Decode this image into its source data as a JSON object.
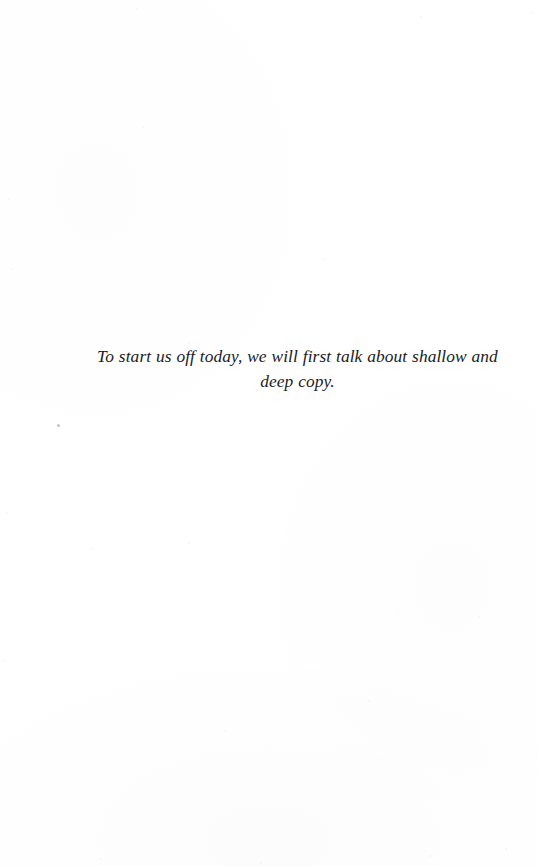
{
  "page": {
    "background_color": "#ffffff",
    "text_color": "#1b1b1f",
    "width": 537,
    "height": 866
  },
  "epigraph": {
    "line_1": "To start us off today, we will first talk about shallow and",
    "line_2": "deep copy.",
    "full_text": "To start us off today, we will first talk about shallow and deep copy.",
    "style": "italic",
    "alignment": "center"
  },
  "artifacts": {
    "speck_label": "scan-speck",
    "noise": [
      {
        "x": 136,
        "y": 8
      },
      {
        "x": 420,
        "y": 16
      },
      {
        "x": 530,
        "y": 12
      },
      {
        "x": 142,
        "y": 126
      },
      {
        "x": 8,
        "y": 198
      },
      {
        "x": 12,
        "y": 268
      },
      {
        "x": 188,
        "y": 342
      },
      {
        "x": 322,
        "y": 258
      },
      {
        "x": 6,
        "y": 512
      },
      {
        "x": 92,
        "y": 548
      },
      {
        "x": 188,
        "y": 542
      },
      {
        "x": 478,
        "y": 616
      },
      {
        "x": 3,
        "y": 660
      },
      {
        "x": 224,
        "y": 730
      },
      {
        "x": 368,
        "y": 700
      },
      {
        "x": 100,
        "y": 858
      },
      {
        "x": 260,
        "y": 862
      },
      {
        "x": 430,
        "y": 855
      },
      {
        "x": 505,
        "y": 848
      }
    ]
  }
}
